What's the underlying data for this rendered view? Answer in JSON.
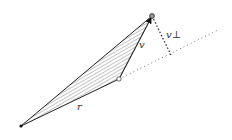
{
  "diagram": {
    "labels": {
      "r": "r",
      "v": "v",
      "v_perp": "v⊥"
    },
    "points": {
      "origin": [
        21,
        126
      ],
      "r_end": [
        119,
        79
      ],
      "v_end": [
        152,
        16
      ],
      "perp_foot": [
        171,
        55
      ],
      "line_end": [
        216,
        31
      ]
    },
    "colors": {
      "stroke": "#222222",
      "hatch": "#555555",
      "dotted": "#777777"
    }
  }
}
